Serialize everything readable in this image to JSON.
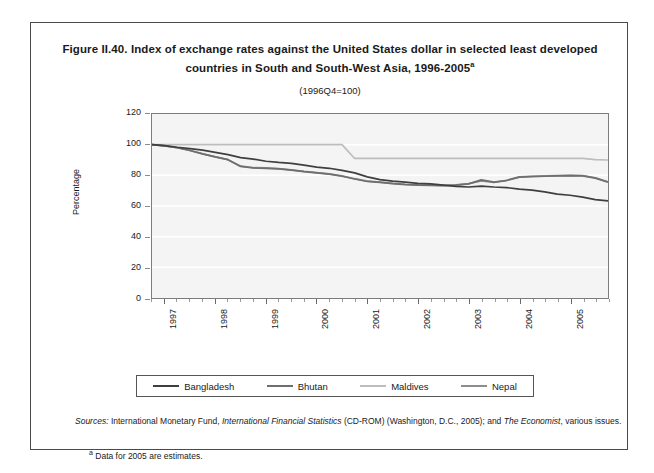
{
  "figure": {
    "title_line1": "Figure II.40. Index of exchange rates against the United States dollar in selected least",
    "title_line2": "developed countries in South and South-West Asia, 1996-2005",
    "title_superscript": "a",
    "subtitle": "(1996Q4=100)"
  },
  "sources": {
    "label": "Sources:",
    "text_1": "International Monetary Fund,",
    "italic_1": "International Financial Statistics",
    "text_2": "(CD-ROM) (Washington, D.C., 2005); and",
    "italic_2": "The Economist",
    "text_3": ", various issues."
  },
  "footnote": {
    "marker": "a",
    "text": "Data for 2005 are estimates."
  },
  "colors": {
    "bangladesh": "#3f3f3f",
    "bhutan": "#6e6e6e",
    "maldives": "#bdbdbd",
    "nepal": "#8d8d8d",
    "plot_background": "#f4f4f4",
    "gridline": "#ffffff",
    "axis": "#7d7d7d"
  },
  "chart_data": {
    "type": "line",
    "title": "Index of exchange rates against the United States dollar in selected least developed countries in South and South-West Asia, 1996-2005",
    "subtitle": "(1996Q4=100)",
    "xlabel": "",
    "ylabel": "Percentage",
    "ylim": [
      0,
      120
    ],
    "yticks": [
      0,
      20,
      40,
      60,
      80,
      100,
      120
    ],
    "xlim": [
      "1996Q4",
      "2005Q4"
    ],
    "xticks": [
      "1997",
      "1998",
      "1999",
      "2000",
      "2001",
      "2002",
      "2003",
      "2004",
      "2005"
    ],
    "x_minor_ticks": "quarterly",
    "grid": "horizontal",
    "legend_position": "bottom",
    "x": [
      "1996Q4",
      "1997Q1",
      "1997Q2",
      "1997Q3",
      "1997Q4",
      "1998Q1",
      "1998Q2",
      "1998Q3",
      "1998Q4",
      "1999Q1",
      "1999Q2",
      "1999Q3",
      "1999Q4",
      "2000Q1",
      "2000Q2",
      "2000Q3",
      "2000Q4",
      "2001Q1",
      "2001Q2",
      "2001Q3",
      "2001Q4",
      "2002Q1",
      "2002Q2",
      "2002Q3",
      "2002Q4",
      "2003Q1",
      "2003Q2",
      "2003Q3",
      "2003Q4",
      "2004Q1",
      "2004Q2",
      "2004Q3",
      "2004Q4",
      "2005Q1",
      "2005Q2",
      "2005Q3",
      "2005Q4"
    ],
    "series": [
      {
        "name": "Bangladesh",
        "color": "#3f3f3f",
        "values": [
          100,
          99.4,
          98.3,
          97.4,
          96.4,
          95.0,
          93.5,
          91.6,
          90.6,
          89.2,
          88.4,
          87.8,
          86.6,
          85.4,
          84.6,
          83.2,
          81.6,
          79.0,
          77.2,
          76.2,
          75.6,
          74.8,
          74.4,
          73.6,
          72.8,
          72.4,
          73.0,
          72.4,
          72.0,
          71.0,
          70.4,
          69.2,
          67.8,
          67.0,
          65.8,
          64.2,
          63.4
        ]
      },
      {
        "name": "Bhutan",
        "color": "#6e6e6e",
        "values": [
          100,
          99.2,
          98.0,
          96.2,
          94.0,
          92.0,
          90.2,
          85.8,
          84.8,
          84.6,
          84.2,
          83.4,
          82.4,
          81.6,
          80.8,
          79.4,
          77.6,
          76.0,
          75.4,
          74.6,
          74.0,
          73.6,
          73.4,
          73.2,
          73.6,
          74.4,
          77.0,
          75.6,
          76.6,
          78.8,
          79.2,
          79.4,
          79.6,
          79.8,
          79.6,
          78.2,
          75.6
        ]
      },
      {
        "name": "Maldives",
        "color": "#bdbdbd",
        "values": [
          100,
          100,
          100,
          100,
          100,
          100,
          100,
          100,
          100,
          100,
          100,
          100,
          100,
          100,
          100,
          100,
          91.0,
          91.0,
          91.0,
          91.0,
          91.0,
          91.0,
          91.0,
          91.0,
          91.0,
          91.0,
          91.0,
          91.0,
          91.0,
          91.0,
          91.0,
          91.0,
          91.0,
          91.0,
          91.0,
          90.2,
          90.0
        ]
      },
      {
        "name": "Nepal",
        "color": "#8d8d8d",
        "values": [
          100,
          99.2,
          98.0,
          96.2,
          94.0,
          92.0,
          90.2,
          86.0,
          85.0,
          84.8,
          84.4,
          83.6,
          82.6,
          81.8,
          81.0,
          79.6,
          77.8,
          76.2,
          75.6,
          74.8,
          74.2,
          73.8,
          73.6,
          73.4,
          73.8,
          74.6,
          76.4,
          75.4,
          76.8,
          79.0,
          79.4,
          79.6,
          79.8,
          80.0,
          79.8,
          78.4,
          75.8
        ]
      }
    ]
  }
}
